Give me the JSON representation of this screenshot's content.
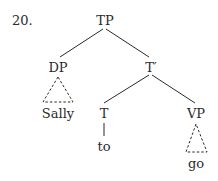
{
  "example_number": "20.",
  "tree": {
    "root": "TP",
    "nodes": {
      "tp": "TP",
      "dp": "DP",
      "t_bar": "T′",
      "t": "T",
      "vp": "VP"
    },
    "leaves": {
      "dp_leaf": "Sally",
      "t_leaf": "to",
      "vp_leaf": "go"
    },
    "triangle_nodes": [
      "DP",
      "VP"
    ],
    "line_color": "#2a2a2a"
  }
}
